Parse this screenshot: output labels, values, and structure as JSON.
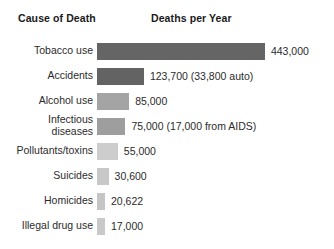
{
  "header": {
    "cause_label": "Cause of Death",
    "deaths_label": "Deaths per Year"
  },
  "rows": [
    {
      "label": "Tobacco use",
      "value_label": "443,000",
      "value": 443000,
      "color": "#656565"
    },
    {
      "label": "Accidents",
      "value_label": "123,700 (33,800 auto)",
      "value": 123700,
      "color": "#636363"
    },
    {
      "label": "Alcohol use",
      "value_label": "85,000",
      "value": 85000,
      "color": "#a4a4a4"
    },
    {
      "label": "Infectious\ndiseases",
      "value_label": "75,000 (17,000 from AIDS)",
      "value": 75000,
      "color": "#9e9e9e"
    },
    {
      "label": "Pollutants/toxins",
      "value_label": "55,000",
      "value": 55000,
      "color": "#cdcdcd"
    },
    {
      "label": "Suicides",
      "value_label": "30,600",
      "value": 30600,
      "color": "#c8c8c8"
    },
    {
      "label": "Homicides",
      "value_label": "20,622",
      "value": 20622,
      "color": "#c5c5c5"
    },
    {
      "label": "Illegal drug use",
      "value_label": "17,000",
      "value": 17000,
      "color": "#c9c9c9"
    }
  ],
  "chart_data": {
    "type": "bar",
    "orientation": "horizontal",
    "title": "",
    "xlabel": "Deaths per Year",
    "ylabel": "Cause of Death",
    "categories": [
      "Tobacco use",
      "Accidents",
      "Alcohol use",
      "Infectious diseases",
      "Pollutants/toxins",
      "Suicides",
      "Homicides",
      "Illegal drug use"
    ],
    "values": [
      443000,
      123700,
      85000,
      75000,
      55000,
      30600,
      20622,
      17000
    ],
    "value_labels": [
      "443,000",
      "123,700 (33,800 auto)",
      "85,000",
      "75,000 (17,000 from AIDS)",
      "55,000",
      "30,600",
      "20,622",
      "17,000"
    ],
    "annotations": [
      "Accidents: 33,800 auto",
      "Infectious diseases: 17,000 from AIDS"
    ],
    "xlim": [
      0,
      443000
    ],
    "grid": false,
    "legend": "none",
    "bar_colors": [
      "#656565",
      "#636363",
      "#a4a4a4",
      "#9e9e9e",
      "#cdcdcd",
      "#c8c8c8",
      "#c5c5c5",
      "#c9c9c9"
    ]
  },
  "layout": {
    "bar_origin_x": 97,
    "px_per_unit": 0.000379,
    "min_bar_px": 8
  }
}
